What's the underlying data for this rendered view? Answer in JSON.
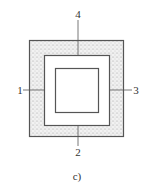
{
  "figure": {
    "caption": "c)",
    "labels": {
      "top": "4",
      "bottom": "2",
      "left": "1",
      "right": "3"
    },
    "colors": {
      "stroke": "#555555",
      "fill_hatch": "#e8e8e8",
      "dots": "#888888",
      "background": "#ffffff"
    }
  }
}
